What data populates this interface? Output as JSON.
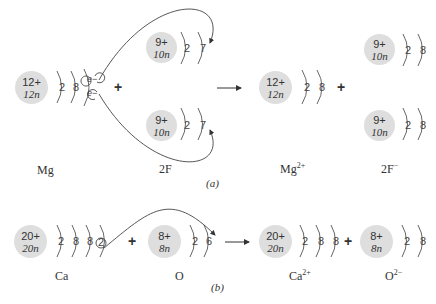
{
  "part_a": {
    "caption": "(a)",
    "reactants": [
      {
        "label": "Mg",
        "nucleus": {
          "protons": "12+",
          "neutrons": "12n"
        },
        "shells": [
          "2",
          "8"
        ],
        "valence_electrons": [
          "e−",
          "e−"
        ]
      },
      {
        "label": "2F",
        "atoms": [
          {
            "nucleus": {
              "protons": "9+",
              "neutrons": "10n"
            },
            "shells": [
              "2",
              "7"
            ]
          },
          {
            "nucleus": {
              "protons": "9+",
              "neutrons": "10n"
            },
            "shells": [
              "2",
              "7"
            ]
          }
        ]
      }
    ],
    "products": [
      {
        "label": "Mg",
        "charge": "2+",
        "nucleus": {
          "protons": "12+",
          "neutrons": "12n"
        },
        "shells": [
          "2",
          "8"
        ]
      },
      {
        "label": "2F",
        "charge": "−",
        "atoms": [
          {
            "nucleus": {
              "protons": "9+",
              "neutrons": "10n"
            },
            "shells": [
              "2",
              "8"
            ]
          },
          {
            "nucleus": {
              "protons": "9+",
              "neutrons": "10n"
            },
            "shells": [
              "2",
              "8"
            ]
          }
        ]
      }
    ],
    "plus": "+"
  },
  "part_b": {
    "caption": "(b)",
    "reactants": [
      {
        "label": "Ca",
        "nucleus": {
          "protons": "20+",
          "neutrons": "20n"
        },
        "shells": [
          "2",
          "8",
          "8",
          "2"
        ]
      },
      {
        "label": "O",
        "nucleus": {
          "protons": "8+",
          "neutrons": "8n"
        },
        "shells": [
          "2",
          "6"
        ]
      }
    ],
    "products": [
      {
        "label": "Ca",
        "charge": "2+",
        "nucleus": {
          "protons": "20+",
          "neutrons": "20n"
        },
        "shells": [
          "2",
          "8",
          "8"
        ]
      },
      {
        "label": "O",
        "charge": "2−",
        "nucleus": {
          "protons": "8+",
          "neutrons": "8n"
        },
        "shells": [
          "2",
          "8"
        ]
      }
    ],
    "plus": "+"
  },
  "colors": {
    "nucleus": "#dedede",
    "lines": "#444444",
    "text": "#333333"
  }
}
